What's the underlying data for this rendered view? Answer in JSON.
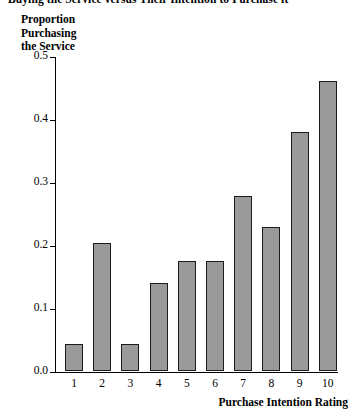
{
  "chart_data": {
    "type": "bar",
    "title": "Buying the Service versus Their Intention to Purchase it",
    "xlabel": "Purchase Intention Rating",
    "ylabel": "Proportion Purchasing the Service",
    "ylabel_lines": [
      "Proportion",
      "Purchasing",
      "the Service"
    ],
    "categories": [
      "1",
      "2",
      "3",
      "4",
      "5",
      "6",
      "7",
      "8",
      "9",
      "10"
    ],
    "values": [
      0.043,
      0.203,
      0.043,
      0.14,
      0.175,
      0.175,
      0.278,
      0.228,
      0.38,
      0.46
    ],
    "ylim": [
      0.0,
      0.5
    ],
    "ytick_labels": [
      "0.5",
      "0.4",
      "0.3",
      "0.2",
      "0.1",
      "0.0"
    ],
    "ytick_values": [
      0.5,
      0.4,
      0.3,
      0.2,
      0.1,
      0.0
    ],
    "grid": false,
    "legend": "none",
    "bar_fill_color": "#9a9a9a",
    "bar_border_color": "#1c1c1c",
    "axis_color": "#000000",
    "background_color": "#ffffff"
  }
}
